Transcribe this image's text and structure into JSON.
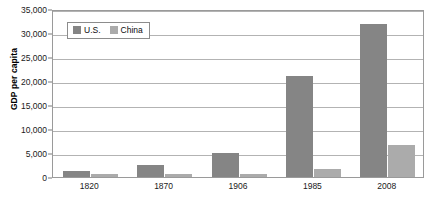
{
  "chart_data": {
    "type": "bar",
    "title": "",
    "subtitle": "",
    "xlabel": "",
    "ylabel": "GDP per capita",
    "categories": [
      "1820",
      "1870",
      "1906",
      "1985",
      "2008"
    ],
    "series": [
      {
        "name": "U.S.",
        "color": "#858585",
        "values": [
          1250,
          2450,
          5000,
          21000,
          31800
        ]
      },
      {
        "name": "China",
        "color": "#ababab",
        "values": [
          600,
          530,
          530,
          1700,
          6700
        ]
      }
    ],
    "ylim": [
      0,
      35000
    ],
    "ytick_values": [
      0,
      5000,
      10000,
      15000,
      20000,
      25000,
      30000,
      35000
    ],
    "ytick_labels": [
      "0",
      "5,000",
      "10,000",
      "15,000",
      "20,000",
      "25,000",
      "30,000",
      "35,000"
    ],
    "grid": "horizontal",
    "legend_position": "top-left-inside",
    "plot_border": true,
    "annotations": []
  },
  "legend": {
    "entries": [
      {
        "label": "U.S.",
        "swatch": "legend-swatch-us"
      },
      {
        "label": "China",
        "swatch": "legend-swatch-china"
      }
    ]
  },
  "colors": {
    "series_us": "#858585",
    "series_china": "#ababab",
    "gridline": "#b3b3b3",
    "plot_border": "#9a9a9a",
    "text": "#1a1a1a",
    "background": "#ffffff"
  }
}
